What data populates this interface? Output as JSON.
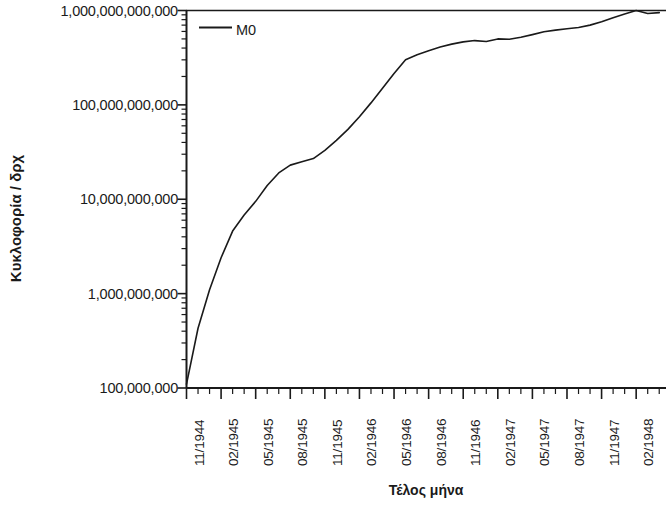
{
  "chart_data": {
    "type": "line",
    "title": "",
    "xlabel": "Τέλος μήνα",
    "ylabel": "Κυκλοφορία / δρχ",
    "yscale": "log",
    "ylim": [
      100000000,
      1000000000000
    ],
    "ytick_labels": [
      "1,000,000,000,000",
      "100,000,000,000",
      "10,000,000,000",
      "1,000,000,000",
      "100,000,000"
    ],
    "ytick_values": [
      1000000000000,
      100000000000,
      10000000000,
      1000000000,
      100000000
    ],
    "xtick_labels": [
      "11/1944",
      "02/1945",
      "05/1945",
      "08/1945",
      "11/1945",
      "02/1946",
      "05/1946",
      "08/1946",
      "11/1946",
      "02/1947",
      "05/1947",
      "08/1947",
      "11/1947",
      "02/1948"
    ],
    "xlim": [
      "11/1944",
      "04/1948"
    ],
    "grid": false,
    "legend_position": "top-left",
    "legend": [
      "M0"
    ],
    "series": [
      {
        "name": "M0",
        "x": [
          "11/1944",
          "12/1944",
          "01/1945",
          "02/1945",
          "03/1945",
          "04/1945",
          "05/1945",
          "06/1945",
          "07/1945",
          "08/1945",
          "09/1945",
          "10/1945",
          "11/1945",
          "12/1945",
          "01/1946",
          "02/1946",
          "03/1946",
          "04/1946",
          "05/1946",
          "06/1946",
          "07/1946",
          "08/1946",
          "09/1946",
          "10/1946",
          "11/1946",
          "12/1946",
          "01/1947",
          "02/1947",
          "03/1947",
          "04/1947",
          "05/1947",
          "06/1947",
          "07/1947",
          "08/1947",
          "09/1947",
          "10/1947",
          "11/1947",
          "12/1947",
          "01/1948",
          "02/1948",
          "03/1948",
          "04/1948"
        ],
        "values": [
          110000000,
          430000000,
          1100000000,
          2400000000,
          4600000000,
          6800000000,
          9500000000,
          14000000000,
          19000000000,
          23000000000,
          25000000000,
          27000000000,
          33000000000,
          42000000000,
          55000000000,
          75000000000,
          105000000000,
          150000000000,
          215000000000,
          300000000000,
          340000000000,
          375000000000,
          410000000000,
          440000000000,
          465000000000,
          480000000000,
          470000000000,
          500000000000,
          495000000000,
          520000000000,
          555000000000,
          595000000000,
          620000000000,
          640000000000,
          660000000000,
          700000000000,
          760000000000,
          840000000000,
          920000000000,
          1000000000000,
          930000000000,
          950000000000
        ]
      }
    ]
  },
  "axes": {
    "line_color": "#1a1a1a"
  }
}
